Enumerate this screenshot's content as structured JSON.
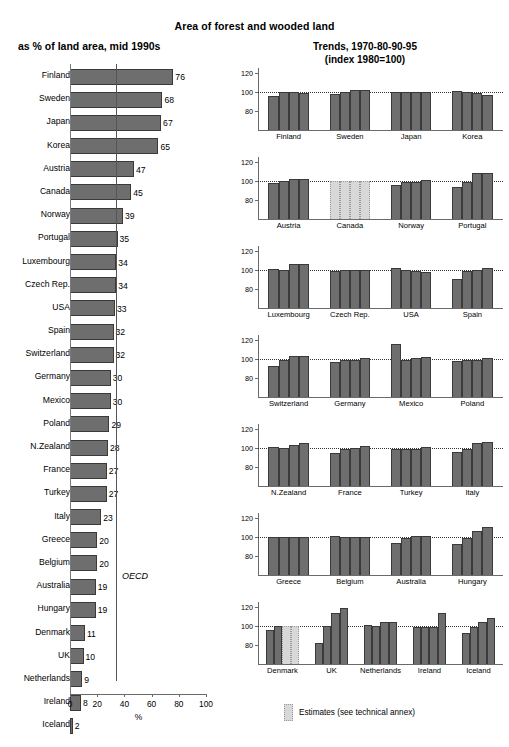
{
  "titles": {
    "main": "Area of forest and wooded land",
    "left_subtitle": "as % of land area, mid 1990s",
    "right_subtitle_line1": "Trends, 1970-80-90-95",
    "right_subtitle_line2": "(index 1980=100)"
  },
  "left_axis": {
    "x_title": "%",
    "ticks": [
      "0",
      "20",
      "40",
      "60",
      "80",
      "100"
    ],
    "oecd_label": "OECD"
  },
  "legend": {
    "estimates_label": "Estimates (see technical annex)",
    "estimate_color": "#d8d8d8",
    "bar_color": "#6e6e6e"
  },
  "right_axis": {
    "ticks": [
      "120",
      "100",
      "80"
    ]
  },
  "chart_data": [
    {
      "type": "bar",
      "title": "Area of forest and wooded land",
      "subtitle": "as % of land area, mid 1990s",
      "orientation": "horizontal",
      "xlabel": "%",
      "ylabel": "",
      "xlim": [
        0,
        100
      ],
      "grid": false,
      "reference_line": {
        "label": "OECD",
        "value": 34
      },
      "categories": [
        "Finland",
        "Sweden",
        "Japan",
        "Korea",
        "Austria",
        "Canada",
        "Norway",
        "Portugal",
        "Luxembourg",
        "Czech Rep.",
        "USA",
        "Spain",
        "Switzerland",
        "Germany",
        "Mexico",
        "Poland",
        "N.Zealand",
        "France",
        "Turkey",
        "Italy",
        "Greece",
        "Belgium",
        "Australia",
        "Hungary",
        "Denmark",
        "UK",
        "Netherlands",
        "Ireland",
        "Iceland"
      ],
      "values": [
        76,
        68,
        67,
        65,
        47,
        45,
        39,
        35,
        34,
        34,
        33,
        32,
        32,
        30,
        30,
        29,
        28,
        27,
        27,
        23,
        20,
        20,
        19,
        19,
        11,
        10,
        9,
        8,
        2
      ]
    },
    {
      "type": "bar",
      "title": "Trends, 1970-80-90-95",
      "subtitle": "(index 1980=100)",
      "orientation": "vertical",
      "xlabel": "",
      "ylabel": "index 1980=100",
      "ylim": [
        60,
        125
      ],
      "yticks": [
        80,
        100,
        120
      ],
      "reference_line": {
        "value": 100
      },
      "series_years": [
        "1970",
        "1980",
        "1990",
        "1995"
      ],
      "rows": [
        {
          "groups": [
            {
              "name": "Finland",
              "values": [
                96,
                100,
                100,
                99
              ],
              "estimate": false
            },
            {
              "name": "Sweden",
              "values": [
                98,
                100,
                102,
                102
              ],
              "estimate": false
            },
            {
              "name": "Japan",
              "values": [
                100,
                100,
                100,
                100
              ],
              "estimate": false
            },
            {
              "name": "Korea",
              "values": [
                101,
                100,
                99,
                97
              ],
              "estimate": false
            }
          ]
        },
        {
          "groups": [
            {
              "name": "Austria",
              "values": [
                98,
                100,
                102,
                102
              ],
              "estimate": false
            },
            {
              "name": "Canada",
              "values": [
                100,
                100,
                100,
                100
              ],
              "estimate": true
            },
            {
              "name": "Norway",
              "values": [
                96,
                99,
                99,
                101
              ],
              "estimate": false
            },
            {
              "name": "Portugal",
              "values": [
                94,
                99,
                108,
                108
              ],
              "estimate": false
            }
          ]
        },
        {
          "groups": [
            {
              "name": "Luxembourg",
              "values": [
                101,
                100,
                106,
                106
              ],
              "estimate": false
            },
            {
              "name": "Czech Rep.",
              "values": [
                99,
                100,
                100,
                100
              ],
              "estimate": false
            },
            {
              "name": "USA",
              "values": [
                102,
                100,
                99,
                98
              ],
              "estimate": false
            },
            {
              "name": "Spain",
              "values": [
                90,
                99,
                100,
                102
              ],
              "estimate": false
            }
          ]
        },
        {
          "groups": [
            {
              "name": "Switzerland",
              "values": [
                93,
                99,
                103,
                103
              ],
              "estimate": false
            },
            {
              "name": "Germany",
              "values": [
                97,
                99,
                99,
                101
              ],
              "estimate": false
            },
            {
              "name": "Mexico",
              "values": [
                116,
                99,
                101,
                102
              ],
              "estimate": false
            },
            {
              "name": "Poland",
              "values": [
                98,
                99,
                99,
                101
              ],
              "estimate": false
            }
          ]
        },
        {
          "groups": [
            {
              "name": "N.Zealand",
              "values": [
                101,
                100,
                103,
                105
              ],
              "estimate": false
            },
            {
              "name": "France",
              "values": [
                95,
                99,
                100,
                102
              ],
              "estimate": false
            },
            {
              "name": "Turkey",
              "values": [
                99,
                99,
                99,
                101
              ],
              "estimate": false
            },
            {
              "name": "Italy",
              "values": [
                96,
                99,
                105,
                106
              ],
              "estimate": false
            }
          ]
        },
        {
          "groups": [
            {
              "name": "Greece",
              "values": [
                100,
                100,
                100,
                100
              ],
              "estimate": false
            },
            {
              "name": "Belgium",
              "values": [
                101,
                100,
                100,
                100
              ],
              "estimate": false
            },
            {
              "name": "Australia",
              "values": [
                94,
                99,
                101,
                101
              ],
              "estimate": false
            },
            {
              "name": "Hungary",
              "values": [
                92,
                99,
                106,
                110
              ],
              "estimate": false
            }
          ]
        },
        {
          "groups": [
            {
              "name": "Denmark",
              "values": [
                96,
                100,
                100,
                100
              ],
              "estimate": false,
              "estimate_bars": [
                false,
                false,
                true,
                true
              ]
            },
            {
              "name": "UK",
              "values": [
                82,
                100,
                113,
                119
              ],
              "estimate": false
            },
            {
              "name": "Netherlands",
              "values": [
                101,
                100,
                104,
                104
              ],
              "estimate": false
            },
            {
              "name": "Ireland",
              "values": [
                99,
                99,
                99,
                113
              ],
              "estimate": false
            },
            {
              "name": "Iceland",
              "values": [
                93,
                99,
                104,
                108
              ],
              "estimate": false
            }
          ]
        }
      ]
    }
  ]
}
